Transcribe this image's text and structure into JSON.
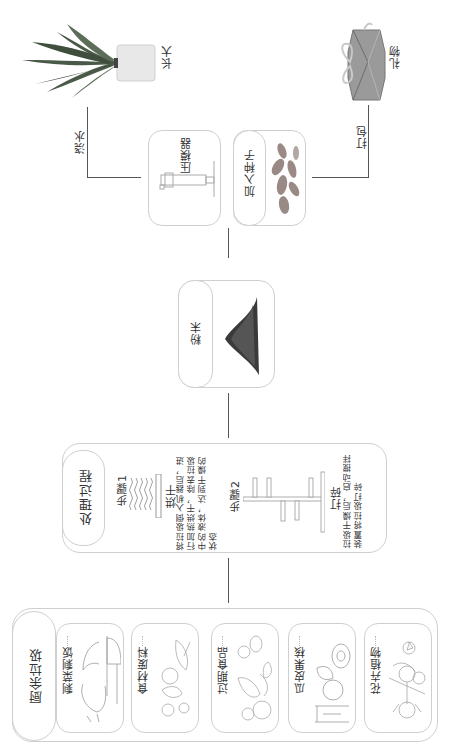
{
  "orientation": "rotated 90° counter-clockwise",
  "kitchen_waste": {
    "title": "厨余垃圾",
    "items": [
      {
        "label": "剩菜剩饭",
        "icon": "leftovers-drawing"
      },
      {
        "label": "食材废料",
        "icon": "food-scraps-drawing"
      },
      {
        "label": "过期食品",
        "icon": "expired-food-drawing"
      },
      {
        "label": "瓜皮果核",
        "icon": "fruit-peel-drawing"
      },
      {
        "label": "花卉植物",
        "icon": "flowers-drawing"
      }
    ]
  },
  "process": {
    "title": "处理过程",
    "step1": {
      "label": "步骤1",
      "name": "烘干",
      "desc": "将拉圾倒入机器后，进行加热烘干，除去拉圾中的液体，达到干燥的状态"
    },
    "step2": {
      "label": "步骤2",
      "name": "打碎",
      "desc": "拉圾干燥后，启动搅拌装置将拉圾打碎"
    }
  },
  "powder": {
    "label": "粉末"
  },
  "mold": {
    "label": "压模器"
  },
  "seeds": {
    "label": "加入种子"
  },
  "branches": {
    "left": {
      "edge_label": "浇水",
      "result_label": "长大"
    },
    "right": {
      "edge_label": "打包",
      "result_label": "礼物"
    }
  },
  "colors": {
    "border": "#cfcfcf",
    "line": "#555555",
    "text": "#333333"
  }
}
